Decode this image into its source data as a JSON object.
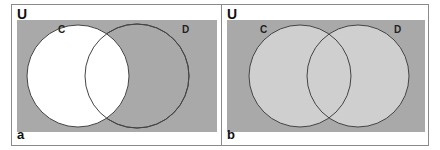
{
  "panels": [
    {
      "id": "a",
      "universe_label": "U",
      "caption": "a",
      "set_labels": [
        "C",
        "D"
      ],
      "shading": "C shaded white (unshaded), rest of universe gray",
      "colors": {
        "universe": "#a9a9a9",
        "set_c": "#ffffff",
        "set_d": "#a9a9a9",
        "outline": "#444444"
      }
    },
    {
      "id": "b",
      "universe_label": "U",
      "caption": "b",
      "set_labels": [
        "C",
        "D"
      ],
      "shading": "C union D shaded light gray, rest of universe darker gray",
      "colors": {
        "universe": "#a9a9a9",
        "set_c": "#cfcfcf",
        "set_d": "#cfcfcf",
        "outline": "#444444"
      }
    }
  ]
}
